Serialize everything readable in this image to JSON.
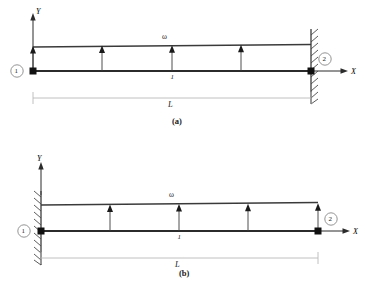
{
  "document": {
    "title": "Beam with uniformly distributed load - fixed support configurations"
  },
  "figures": [
    {
      "id": "a",
      "caption": "(a)",
      "axes": {
        "y_label": "Y",
        "x_label": "X"
      },
      "load_label": "ω",
      "element_label": "1",
      "dimension_label": "L",
      "nodes": [
        {
          "label": "1",
          "position": "left"
        },
        {
          "label": "2",
          "position": "right"
        }
      ],
      "support": {
        "type": "fixed-wall",
        "side": "right"
      },
      "load": {
        "type": "uniformly-distributed",
        "direction": "up",
        "arrow_count": 4
      }
    },
    {
      "id": "b",
      "caption": "(b)",
      "axes": {
        "y_label": "Y",
        "x_label": "X"
      },
      "load_label": "ω",
      "element_label": "1",
      "dimension_label": "L",
      "nodes": [
        {
          "label": "1",
          "position": "left"
        },
        {
          "label": "2",
          "position": "right"
        }
      ],
      "support": {
        "type": "fixed-wall",
        "side": "left"
      },
      "load": {
        "type": "uniformly-distributed",
        "direction": "up",
        "arrow_count": 4
      }
    }
  ],
  "colors": {
    "beam": "#2b2b2b",
    "load_line": "#3a3a3a",
    "dimension": "#b9b9b9",
    "wall": "#4a4a4a",
    "text": "#1a1a1a"
  }
}
